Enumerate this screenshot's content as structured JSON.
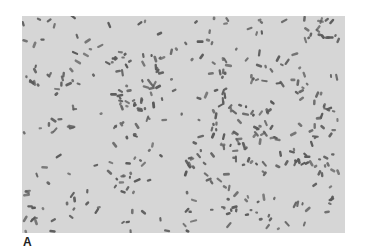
{
  "figure": {
    "panel_label": "A",
    "image": {
      "description": "Light micrograph of scattered rod-shaped bacteria on a pale gray background",
      "background_color": "#d6d6d6",
      "cell_color": "#5a5a5a",
      "cell_count_approx": 420,
      "seed": 7
    }
  }
}
